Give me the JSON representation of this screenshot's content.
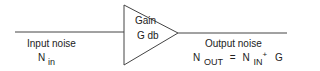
{
  "amplifier": {
    "label_line1": "Gain",
    "label_line2": "G db"
  },
  "input": {
    "caption": "Input noise",
    "symbol": "N",
    "subscript": "in"
  },
  "output": {
    "caption": "Output noise",
    "formula": {
      "lhs_symbol": "N",
      "lhs_subscript": "OUT",
      "equals": "=",
      "rhs_symbol": "N",
      "rhs_subscript": "IN",
      "plus": "+",
      "gain": "G"
    }
  },
  "colors": {
    "stroke": "#444444",
    "text": "#222222",
    "background": "#ffffff"
  }
}
